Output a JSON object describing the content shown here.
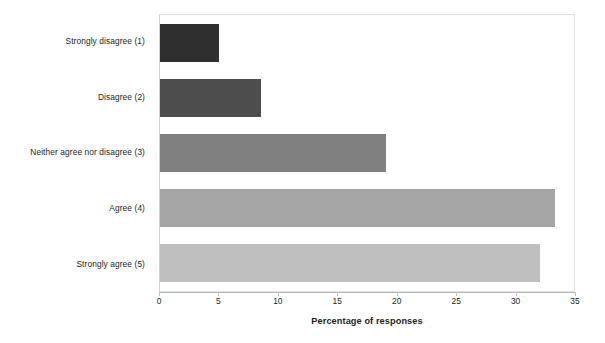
{
  "chart_data": {
    "type": "bar",
    "orientation": "horizontal",
    "title": "",
    "xlabel": "Percentage of responses",
    "ylabel": "",
    "categories": [
      "Strongly disagree (1)",
      "Disagree (2)",
      "Neither agree nor disagree (3)",
      "Agree (4)",
      "Strongly agree (5)"
    ],
    "values": [
      5.0,
      8.5,
      19.0,
      33.2,
      32.0
    ],
    "xlim": [
      0,
      35
    ],
    "xticks": [
      0,
      5,
      10,
      15,
      20,
      25,
      30,
      35
    ],
    "xtick_labels": [
      "0",
      "5",
      "10",
      "15",
      "20",
      "25",
      "30",
      "35"
    ],
    "bar_colors": [
      "#2f2f2f",
      "#4d4d4d",
      "#808080",
      "#a6a6a6",
      "#bfbfbf"
    ],
    "grid": false,
    "legend": false
  },
  "axis": {
    "x_title": "Percentage of responses"
  },
  "plot": {
    "border_color": "#e2e2e2",
    "background": "#ffffff"
  }
}
